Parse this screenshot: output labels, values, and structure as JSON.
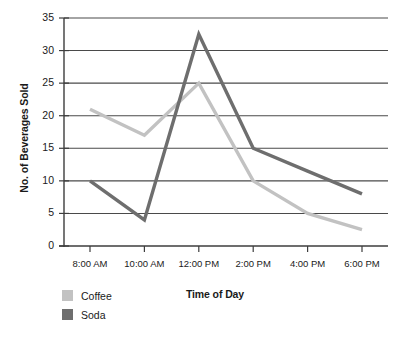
{
  "chart_data": {
    "type": "line",
    "title": "",
    "xlabel": "Time of Day",
    "ylabel": "No. of Beverages Sold",
    "categories": [
      "8:00 AM",
      "10:00 AM",
      "12:00 PM",
      "2:00 PM",
      "4:00 PM",
      "6:00 PM"
    ],
    "series": [
      {
        "name": "Coffee",
        "color": "#c2c2c2",
        "values": [
          21,
          17,
          25,
          10,
          5,
          2.5
        ]
      },
      {
        "name": "Soda",
        "color": "#6e6e6e",
        "values": [
          10,
          4,
          32.5,
          15,
          11.5,
          8
        ]
      }
    ],
    "ylim": [
      0,
      35
    ],
    "ytick_labels": [
      "35",
      "30",
      "25",
      "20",
      "15",
      "10",
      "5",
      "0"
    ],
    "ytick_values": [
      35,
      30,
      25,
      20,
      15,
      10,
      5,
      0
    ],
    "grid": true,
    "legend_position": "bottom-left",
    "axis_color": "#3d3d3d",
    "grid_color": "#4a4a4a"
  }
}
